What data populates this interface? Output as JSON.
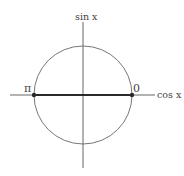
{
  "diagram": {
    "type": "unit-circle",
    "vertical_axis_label": "sin x",
    "horizontal_axis_label": "cos x",
    "highlighted_segment": {
      "description": "horizontal diameter from angle pi to angle 0",
      "from_label": "π",
      "to_label": "0"
    },
    "points": [
      {
        "label": "π",
        "cos": -1,
        "sin": 0
      },
      {
        "label": "0",
        "cos": 1,
        "sin": 0
      }
    ],
    "colors": {
      "axis": "#555555",
      "circle": "#666666",
      "segment": "#2a2a2a",
      "text": "#444444"
    }
  }
}
